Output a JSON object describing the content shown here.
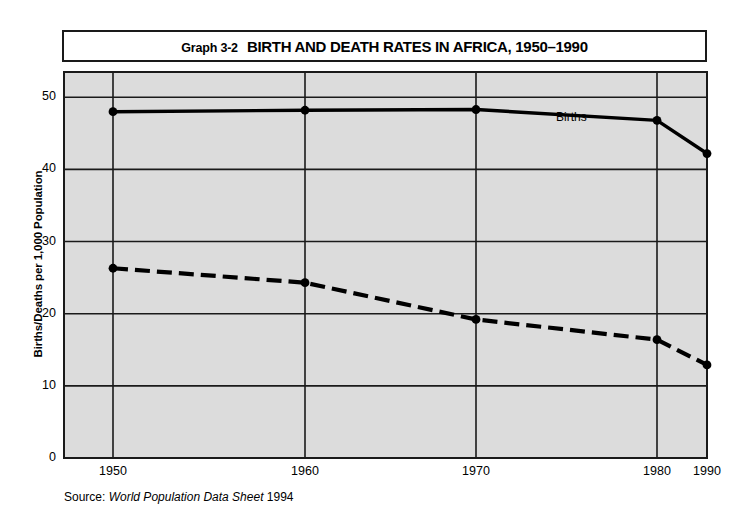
{
  "title": {
    "figure_number": "Graph 3-2",
    "text": "BIRTH AND DEATH RATES IN AFRICA, 1950–1990"
  },
  "source": {
    "prefix": "Source:",
    "publication": "World Population Data Sheet",
    "year": "1994"
  },
  "annotations": {
    "births_label": "Births"
  },
  "colors": {
    "plot_background": "#dcdcdc",
    "frame": "#1a1a1a",
    "gridline": "#1a1a1a",
    "series_line": "#000000",
    "page_background": "#ffffff"
  },
  "chart_data": {
    "type": "line",
    "title": "BIRTH AND DEATH RATES IN AFRICA, 1950–1990",
    "subtitle": "Graph 3-2",
    "xlabel": "",
    "ylabel": "Births/Deaths per 1,000 Population",
    "x": [
      1950,
      1960,
      1970,
      1980,
      1990
    ],
    "xticklabels": [
      "1950",
      "1960",
      "1970",
      "1980",
      "1990"
    ],
    "yticks": [
      0,
      10,
      20,
      30,
      40,
      50
    ],
    "yticklabels": [
      "0",
      "10",
      "20",
      "30",
      "40",
      "50"
    ],
    "ylim": [
      0,
      53.5
    ],
    "grid": "both",
    "legend": "inline-annotation",
    "series": [
      {
        "name": "Births",
        "style": "solid",
        "marker": "circle",
        "values": [
          48.0,
          48.2,
          48.3,
          46.8,
          42.2
        ]
      },
      {
        "name": "Deaths",
        "style": "dashed",
        "marker": "circle",
        "values": [
          26.3,
          24.3,
          19.2,
          16.4,
          12.9
        ]
      }
    ]
  }
}
